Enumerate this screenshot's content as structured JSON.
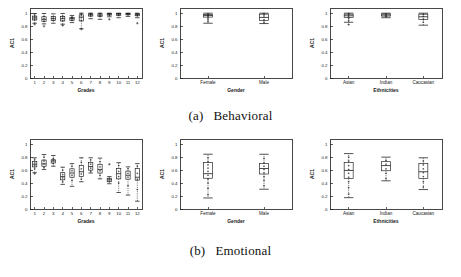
{
  "figure": {
    "background": "#ffffff",
    "ink": "#1a1a1a",
    "subcaptions": [
      {
        "tag": "(a)",
        "text": "Behavioral"
      },
      {
        "tag": "(b)",
        "text": "Emotional"
      }
    ]
  },
  "chart_data": [
    {
      "id": "behavioral-grades",
      "type": "box",
      "title": "",
      "xlabel": "Grades",
      "ylabel": "AC1",
      "ylim": [
        0,
        1.08
      ],
      "yticks": [
        0,
        0.2,
        0.4,
        0.6,
        0.8,
        1
      ],
      "yticklabels": [
        "0",
        "0.2",
        "0.4",
        "0.6",
        "0.8",
        "1"
      ],
      "grid": false,
      "categories": [
        "1",
        "2",
        "3",
        "4",
        "5",
        "6",
        "7",
        "8",
        "9",
        "10",
        "11",
        "12"
      ],
      "boxes": [
        {
          "label": "1",
          "whisker_low": 0.845,
          "q1": 0.895,
          "median": 0.925,
          "q3": 0.955,
          "whisker_high": 0.995,
          "outliers": [
            0.83
          ],
          "points": [
            0.9,
            0.93,
            0.955,
            0.985
          ]
        },
        {
          "label": "2",
          "whisker_low": 0.835,
          "q1": 0.875,
          "median": 0.905,
          "q3": 0.945,
          "whisker_high": 0.995,
          "outliers": [
            0.8
          ],
          "points": [
            0.88,
            0.915,
            0.95
          ]
        },
        {
          "label": "3",
          "whisker_low": 0.845,
          "q1": 0.885,
          "median": 0.915,
          "q3": 0.95,
          "whisker_high": 0.99,
          "outliers": [],
          "points": [
            0.89,
            0.92,
            0.945
          ]
        },
        {
          "label": "4",
          "whisker_low": 0.83,
          "q1": 0.88,
          "median": 0.915,
          "q3": 0.95,
          "whisker_high": 0.995,
          "outliers": [
            0.81
          ],
          "points": [
            0.885,
            0.925,
            0.955
          ]
        },
        {
          "label": "5",
          "whisker_low": 0.855,
          "q1": 0.89,
          "median": 0.915,
          "q3": 0.935,
          "whisker_high": 0.965,
          "outliers": [],
          "points": [
            0.895,
            0.92,
            0.94
          ]
        },
        {
          "label": "6",
          "whisker_low": 0.76,
          "q1": 0.88,
          "median": 0.94,
          "q3": 0.975,
          "whisker_high": 1.0,
          "outliers": [
            0.755
          ],
          "points": [
            0.89,
            0.93,
            0.97,
            0.995
          ]
        },
        {
          "label": "7",
          "whisker_low": 0.915,
          "q1": 0.955,
          "median": 0.975,
          "q3": 0.99,
          "whisker_high": 1.0,
          "outliers": [],
          "points": [
            0.96,
            0.98,
            0.995
          ]
        },
        {
          "label": "8",
          "whisker_low": 0.905,
          "q1": 0.95,
          "median": 0.97,
          "q3": 0.99,
          "whisker_high": 1.0,
          "outliers": [],
          "points": [
            0.955,
            0.975,
            0.995
          ]
        },
        {
          "label": "9",
          "whisker_low": 0.945,
          "q1": 0.97,
          "median": 0.985,
          "q3": 0.995,
          "whisker_high": 1.0,
          "outliers": [
            0.905
          ],
          "points": [
            0.975,
            0.99
          ]
        },
        {
          "label": "10",
          "whisker_low": 0.93,
          "q1": 0.965,
          "median": 0.985,
          "q3": 0.995,
          "whisker_high": 1.0,
          "outliers": [],
          "points": [
            0.97,
            0.99
          ]
        },
        {
          "label": "11",
          "whisker_low": 0.95,
          "q1": 0.975,
          "median": 0.988,
          "q3": 0.996,
          "whisker_high": 1.0,
          "outliers": [],
          "points": [
            0.98,
            0.993
          ]
        },
        {
          "label": "12",
          "whisker_low": 0.93,
          "q1": 0.96,
          "median": 0.978,
          "q3": 0.992,
          "whisker_high": 1.0,
          "outliers": [
            0.845
          ],
          "points": [
            0.965,
            0.985
          ]
        }
      ]
    },
    {
      "id": "behavioral-gender",
      "type": "box",
      "title": "",
      "xlabel": "Gender",
      "ylabel": "AC1",
      "ylim": [
        0,
        1.08
      ],
      "yticks": [
        0,
        0.2,
        0.4,
        0.6,
        0.8,
        1
      ],
      "yticklabels": [
        "0",
        "0.2",
        "0.4",
        "0.6",
        "0.8",
        "1"
      ],
      "grid": false,
      "categories": [
        "Female",
        "Male"
      ],
      "boxes": [
        {
          "label": "Female",
          "whisker_low": 0.845,
          "q1": 0.94,
          "median": 0.965,
          "q3": 0.98,
          "whisker_high": 1.0,
          "outliers": [],
          "points": [
            0.87,
            0.9,
            0.925,
            0.95,
            0.97,
            0.99
          ]
        },
        {
          "label": "Male",
          "whisker_low": 0.84,
          "q1": 0.89,
          "median": 0.935,
          "q3": 0.985,
          "whisker_high": 1.0,
          "outliers": [],
          "points": [
            0.86,
            0.9,
            0.94,
            0.97,
            0.995
          ]
        }
      ]
    },
    {
      "id": "behavioral-ethnicities",
      "type": "box",
      "title": "",
      "xlabel": "Ethnicities",
      "ylabel": "AC1",
      "ylim": [
        0,
        1.08
      ],
      "yticks": [
        0,
        0.2,
        0.4,
        0.6,
        0.8,
        1
      ],
      "yticklabels": [
        "0",
        "0.2",
        "0.4",
        "0.6",
        "0.8",
        "1"
      ],
      "grid": false,
      "categories": [
        "Asian",
        "Indian",
        "Caucasian"
      ],
      "boxes": [
        {
          "label": "Asian",
          "whisker_low": 0.86,
          "q1": 0.935,
          "median": 0.96,
          "q3": 0.985,
          "whisker_high": 1.0,
          "outliers": [
            0.825
          ],
          "points": [
            0.88,
            0.915,
            0.95,
            0.975,
            0.995
          ]
        },
        {
          "label": "Indian",
          "whisker_low": 0.93,
          "q1": 0.955,
          "median": 0.972,
          "q3": 0.988,
          "whisker_high": 1.0,
          "outliers": [],
          "points": [
            0.945,
            0.965,
            0.985
          ]
        },
        {
          "label": "Caucasian",
          "whisker_low": 0.815,
          "q1": 0.9,
          "median": 0.945,
          "q3": 0.985,
          "whisker_high": 1.0,
          "outliers": [],
          "points": [
            0.86,
            0.91,
            0.95,
            0.98
          ]
        }
      ]
    },
    {
      "id": "emotional-grades",
      "type": "box",
      "title": "",
      "xlabel": "Grades",
      "ylabel": "AC1",
      "ylim": [
        0,
        1.08
      ],
      "yticks": [
        0,
        0.2,
        0.4,
        0.6,
        0.8,
        1
      ],
      "yticklabels": [
        "0",
        "0.2",
        "0.4",
        "0.6",
        "0.8",
        "1"
      ],
      "grid": false,
      "categories": [
        "1",
        "2",
        "3",
        "4",
        "5",
        "6",
        "7",
        "8",
        "9",
        "10",
        "11",
        "12"
      ],
      "boxes": [
        {
          "label": "1",
          "whisker_low": 0.56,
          "q1": 0.65,
          "median": 0.69,
          "q3": 0.735,
          "whisker_high": 0.79,
          "outliers": [
            0.545
          ],
          "points": [
            0.62,
            0.67,
            0.71,
            0.76
          ]
        },
        {
          "label": "2",
          "whisker_low": 0.61,
          "q1": 0.66,
          "median": 0.695,
          "q3": 0.755,
          "whisker_high": 0.84,
          "outliers": [],
          "points": [
            0.64,
            0.7,
            0.74,
            0.8
          ]
        },
        {
          "label": "3",
          "whisker_low": 0.66,
          "q1": 0.71,
          "median": 0.74,
          "q3": 0.76,
          "whisker_high": 0.825,
          "outliers": [],
          "points": [
            0.7,
            0.745,
            0.78
          ]
        },
        {
          "label": "4",
          "whisker_low": 0.38,
          "q1": 0.45,
          "median": 0.5,
          "q3": 0.56,
          "whisker_high": 0.645,
          "outliers": [],
          "points": [
            0.42,
            0.48,
            0.53,
            0.6
          ]
        },
        {
          "label": "5",
          "whisker_low": 0.35,
          "q1": 0.49,
          "median": 0.555,
          "q3": 0.62,
          "whisker_high": 0.7,
          "outliers": [],
          "points": [
            0.44,
            0.52,
            0.59,
            0.66
          ]
        },
        {
          "label": "6",
          "whisker_low": 0.42,
          "q1": 0.5,
          "median": 0.575,
          "q3": 0.67,
          "whisker_high": 0.79,
          "outliers": [],
          "points": [
            0.46,
            0.54,
            0.62,
            0.72
          ]
        },
        {
          "label": "7",
          "whisker_low": 0.555,
          "q1": 0.6,
          "median": 0.655,
          "q3": 0.72,
          "whisker_high": 0.79,
          "outliers": [],
          "points": [
            0.58,
            0.63,
            0.69,
            0.755
          ]
        },
        {
          "label": "8",
          "whisker_low": 0.465,
          "q1": 0.555,
          "median": 0.61,
          "q3": 0.69,
          "whisker_high": 0.785,
          "outliers": [],
          "points": [
            0.52,
            0.59,
            0.65,
            0.73
          ]
        },
        {
          "label": "9",
          "whisker_low": 0.39,
          "q1": 0.42,
          "median": 0.45,
          "q3": 0.475,
          "whisker_high": 0.5,
          "outliers": [
            0.69
          ],
          "points": [
            0.43,
            0.465
          ]
        },
        {
          "label": "10",
          "whisker_low": 0.255,
          "q1": 0.465,
          "median": 0.545,
          "q3": 0.625,
          "whisker_high": 0.715,
          "outliers": [],
          "points": [
            0.4,
            0.5,
            0.58,
            0.67
          ]
        },
        {
          "label": "11",
          "whisker_low": 0.215,
          "q1": 0.46,
          "median": 0.52,
          "q3": 0.585,
          "whisker_high": 0.65,
          "outliers": [],
          "points": [
            0.36,
            0.49,
            0.55,
            0.62
          ]
        },
        {
          "label": "12",
          "whisker_low": 0.12,
          "q1": 0.445,
          "median": 0.49,
          "q3": 0.625,
          "whisker_high": 0.7,
          "outliers": [],
          "points": [
            0.3,
            0.46,
            0.55,
            0.66
          ]
        }
      ]
    },
    {
      "id": "emotional-gender",
      "type": "box",
      "title": "",
      "xlabel": "Gender",
      "ylabel": "AC1",
      "ylim": [
        0,
        1.08
      ],
      "yticks": [
        0,
        0.2,
        0.4,
        0.6,
        0.8,
        1
      ],
      "yticklabels": [
        "0",
        "0.2",
        "0.4",
        "0.6",
        "0.8",
        "1"
      ],
      "grid": false,
      "categories": [
        "Female",
        "Male"
      ],
      "boxes": [
        {
          "label": "Female",
          "whisker_low": 0.17,
          "q1": 0.475,
          "median": 0.545,
          "q3": 0.715,
          "whisker_high": 0.845,
          "outliers": [],
          "points": [
            0.22,
            0.32,
            0.4,
            0.46,
            0.52,
            0.58,
            0.63,
            0.68,
            0.73,
            0.79
          ]
        },
        {
          "label": "Male",
          "whisker_low": 0.305,
          "q1": 0.54,
          "median": 0.625,
          "q3": 0.7,
          "whisker_high": 0.845,
          "outliers": [],
          "points": [
            0.36,
            0.44,
            0.5,
            0.56,
            0.61,
            0.66,
            0.71,
            0.78
          ]
        }
      ]
    },
    {
      "id": "emotional-ethnicities",
      "type": "box",
      "title": "",
      "xlabel": "Ethnicities",
      "ylabel": "AC1",
      "ylim": [
        0,
        1.08
      ],
      "yticks": [
        0,
        0.2,
        0.4,
        0.6,
        0.8,
        1
      ],
      "yticklabels": [
        "0",
        "0.2",
        "0.4",
        "0.6",
        "0.8",
        "1"
      ],
      "grid": false,
      "categories": [
        "Asian",
        "Indian",
        "Caucasian"
      ],
      "boxes": [
        {
          "label": "Asian",
          "whisker_low": 0.175,
          "q1": 0.47,
          "median": 0.595,
          "q3": 0.715,
          "whisker_high": 0.855,
          "outliers": [],
          "points": [
            0.23,
            0.33,
            0.42,
            0.49,
            0.55,
            0.61,
            0.67,
            0.74,
            0.8
          ]
        },
        {
          "label": "Indian",
          "whisker_low": 0.435,
          "q1": 0.59,
          "median": 0.67,
          "q3": 0.73,
          "whisker_high": 0.8,
          "outliers": [],
          "points": [
            0.47,
            0.55,
            0.62,
            0.69,
            0.75
          ]
        },
        {
          "label": "Caucasian",
          "whisker_low": 0.3,
          "q1": 0.47,
          "median": 0.575,
          "q3": 0.7,
          "whisker_high": 0.79,
          "outliers": [],
          "points": [
            0.34,
            0.42,
            0.5,
            0.56,
            0.62,
            0.68,
            0.74
          ]
        }
      ]
    }
  ]
}
